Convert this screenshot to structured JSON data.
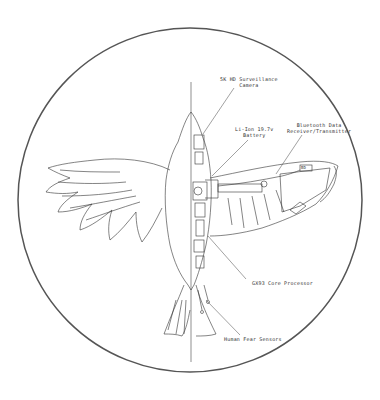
{
  "diagram": {
    "frame_color": "#555555",
    "line_color": "#333333",
    "callouts": [
      {
        "id": "camera",
        "line1": "5K HD Surveillance",
        "line2": "Camera"
      },
      {
        "id": "battery",
        "line1": "Li-Ion 19.7v",
        "line2": "Battery"
      },
      {
        "id": "bluetooth",
        "line1": "Bluetooth Data",
        "line2": "Receiver/Transmitter"
      },
      {
        "id": "processor",
        "line1": "GX93 Core Processor",
        "line2": ""
      },
      {
        "id": "sensors",
        "line1": "Human Fear Sensors",
        "line2": ""
      }
    ],
    "chip_label": "BD"
  }
}
